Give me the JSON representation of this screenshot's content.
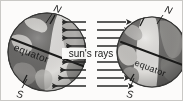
{
  "diagram": {
    "center_label": "sun's rays",
    "canvas": {
      "width": 183,
      "height": 101,
      "background": "#f7f5f1"
    },
    "colors": {
      "ocean_dark": "#6e6a64",
      "ocean_mid": "#8b8780",
      "land_light": "#d9d5cb",
      "land_pale": "#efece3",
      "outline": "#3a3a36",
      "arrow": "#2b2b28",
      "text": "#1d1d1d",
      "frame": "#b9b4ab"
    },
    "globes": [
      {
        "id": "left-globe",
        "name": "left globe",
        "equator_label": "equator",
        "north_label": "N",
        "south_label": "S",
        "cx": 47,
        "cy": 52,
        "r": 39,
        "axis_tilt_deg": -23.5,
        "equator_tilt_deg": 21
      },
      {
        "id": "right-globe",
        "name": "right globe",
        "equator_label": "equator",
        "north_label": "N",
        "south_label": "S",
        "cx": 152,
        "cy": 52,
        "r": 35,
        "axis_tilt_deg": -23.5,
        "equator_tilt_deg": 21
      }
    ],
    "rays": {
      "label": "sun's rays",
      "direction_left": "left",
      "direction_right": "right",
      "row_count": 9,
      "rows_y": [
        22,
        30,
        38,
        46,
        54,
        62,
        70,
        78,
        86
      ]
    }
  }
}
